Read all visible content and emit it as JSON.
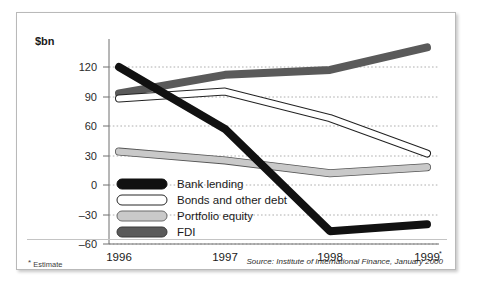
{
  "figure": {
    "unit_label": "$bn",
    "estimate_note_marker": "*",
    "estimate_note_text": "Estimate",
    "source_note": "Source: Institute of International Finance, January 2000"
  },
  "chart_data": {
    "type": "line",
    "title": "",
    "subtitle": "",
    "xlabel": "",
    "ylabel": "$bn",
    "categories": [
      "1996",
      "1997",
      "1998",
      "1999"
    ],
    "x_tick_superscripts": [
      "",
      "",
      "",
      "*"
    ],
    "ylim": [
      -60,
      150
    ],
    "y_ticks": [
      120,
      90,
      60,
      30,
      0,
      -30,
      -60
    ],
    "y_tick_labels": [
      "120",
      "90",
      "60",
      "30",
      "0",
      "–30",
      "–60"
    ],
    "grid": true,
    "legend_position": "inside-bottom-left",
    "series": [
      {
        "name": "Bank lending",
        "color": "#111111",
        "style": "thick-solid-black",
        "values": [
          120,
          57,
          -47,
          -40
        ]
      },
      {
        "name": "Bonds and other debt",
        "color": "#ffffff",
        "outline": "#222222",
        "style": "thick-white-outlined",
        "values": [
          88,
          95,
          68,
          32
        ]
      },
      {
        "name": "Portfolio equity",
        "color": "#c9c9c9",
        "outline": "#555555",
        "style": "thick-lightgrey",
        "values": [
          34,
          25,
          12,
          18
        ]
      },
      {
        "name": "FDI",
        "color": "#5a5a5a",
        "outline": "#3a3a3a",
        "style": "thick-darkgrey",
        "values": [
          93,
          112,
          117,
          140
        ]
      }
    ]
  },
  "legend": {
    "items": [
      {
        "label": "Bank lending",
        "swatch": "black"
      },
      {
        "label": "Bonds and other debt",
        "swatch": "white"
      },
      {
        "label": "Portfolio equity",
        "swatch": "lightgrey"
      },
      {
        "label": "FDI",
        "swatch": "darkgrey"
      }
    ]
  }
}
